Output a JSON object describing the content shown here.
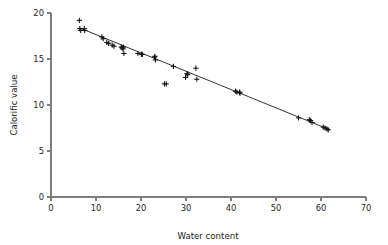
{
  "chart_data": {
    "type": "scatter",
    "title": "",
    "xlabel": "Water content",
    "ylabel": "Calorific value",
    "xlim": [
      0,
      70
    ],
    "ylim": [
      0,
      20
    ],
    "xticks": [
      0,
      10,
      20,
      30,
      40,
      50,
      60,
      70
    ],
    "yticks": [
      0,
      5,
      10,
      15,
      20
    ],
    "xtick_labels": [
      "0",
      "10",
      "20",
      "30",
      "40",
      "50",
      "60",
      "70"
    ],
    "ytick_labels": [
      "0",
      "5",
      "10",
      "15",
      "20"
    ],
    "grid": false,
    "legend": null,
    "marker_style": "plus",
    "marker_color": "#101010",
    "line_color": "#1c1c1c",
    "axis_color": "#7d7d7d",
    "background_color": "#ffffff",
    "series": [
      {
        "name": "observations",
        "type": "scatter",
        "points": [
          [
            6.3,
            19.2
          ],
          [
            6.4,
            18.3
          ],
          [
            6.6,
            18.1
          ],
          [
            7.4,
            18.3
          ],
          [
            7.5,
            18.1
          ],
          [
            11.3,
            17.4
          ],
          [
            11.6,
            17.2
          ],
          [
            12.4,
            16.8
          ],
          [
            12.8,
            16.7
          ],
          [
            13.6,
            16.5
          ],
          [
            14.0,
            16.4
          ],
          [
            15.6,
            16.3
          ],
          [
            15.8,
            16.2
          ],
          [
            16.0,
            16.1
          ],
          [
            16.1,
            16.3
          ],
          [
            16.2,
            15.6
          ],
          [
            19.3,
            15.6
          ],
          [
            20.1,
            15.5
          ],
          [
            20.3,
            15.5
          ],
          [
            23.0,
            15.2
          ],
          [
            23.1,
            15.3
          ],
          [
            23.2,
            14.9
          ],
          [
            25.2,
            12.3
          ],
          [
            25.6,
            12.3
          ],
          [
            27.2,
            14.2
          ],
          [
            29.9,
            13.0
          ],
          [
            30.2,
            13.4
          ],
          [
            30.4,
            13.3
          ],
          [
            32.2,
            14.0
          ],
          [
            32.4,
            12.8
          ],
          [
            41.0,
            11.5
          ],
          [
            41.3,
            11.4
          ],
          [
            41.9,
            11.4
          ],
          [
            42.0,
            11.3
          ],
          [
            55.0,
            8.6
          ],
          [
            57.4,
            8.4
          ],
          [
            57.7,
            8.3
          ],
          [
            58.0,
            8.1
          ],
          [
            60.5,
            7.6
          ],
          [
            60.9,
            7.5
          ],
          [
            61.3,
            7.4
          ],
          [
            61.6,
            7.3
          ]
        ]
      },
      {
        "name": "fitted-line",
        "type": "line",
        "x": [
          6.5,
          62.0
        ],
        "y": [
          18.35,
          7.3
        ]
      }
    ]
  },
  "axes": {
    "x_title": "Water content",
    "y_title": "Calorific value"
  }
}
